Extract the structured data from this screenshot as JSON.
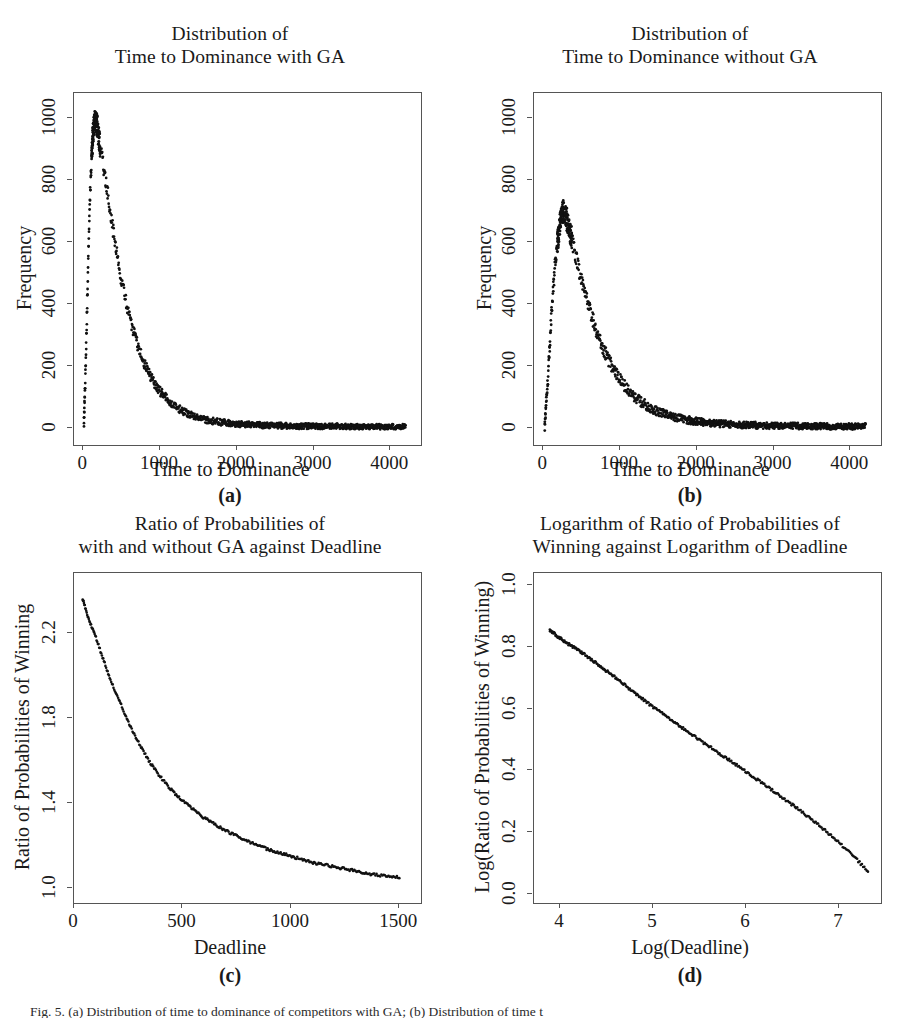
{
  "figure": {
    "caption": "Fig. 5. (a) Distribution of time to dominance of competitors with GA; (b) Distribution of time t"
  },
  "panels": [
    {
      "letter": "(a)",
      "title_line1": "Distribution of",
      "title_line2": "Time to Dominance with GA",
      "xlabel": "Time to Dominance",
      "ylabel": "Frequency",
      "xticks": [
        "0",
        "1000",
        "2000",
        "3000",
        "4000"
      ],
      "yticks": [
        "0",
        "200",
        "400",
        "600",
        "800",
        "1000"
      ]
    },
    {
      "letter": "(b)",
      "title_line1": "Distribution of",
      "title_line2": "Time to Dominance without GA",
      "xlabel": "Time to Dominance",
      "ylabel": "Frequency",
      "xticks": [
        "0",
        "1000",
        "2000",
        "3000",
        "4000"
      ],
      "yticks": [
        "0",
        "200",
        "400",
        "600",
        "800",
        "1000"
      ]
    },
    {
      "letter": "(c)",
      "title_line1": "Ratio of Probabilities of",
      "title_line2": "with and without GA against Deadline",
      "xlabel": "Deadline",
      "ylabel": "Ratio of Probabilities of Winning",
      "xticks": [
        "0",
        "500",
        "1000",
        "1500"
      ],
      "yticks": [
        "1.0",
        "1.4",
        "1.8",
        "2.2"
      ]
    },
    {
      "letter": "(d)",
      "title_line1": "Logarithm of Ratio of Probabilities of",
      "title_line2": "Winning against Logarithm of Deadline",
      "xlabel": "Log(Deadline)",
      "ylabel": "Log(Ratio of Probabilities of Winning)",
      "xticks": [
        "4",
        "5",
        "6",
        "7"
      ],
      "yticks": [
        "0.0",
        "0.2",
        "0.4",
        "0.6",
        "0.8",
        "1.0"
      ]
    }
  ],
  "chart_data": [
    {
      "id": "a",
      "type": "scatter",
      "title": "Distribution of Time to Dominance with GA",
      "xlabel": "Time to Dominance",
      "ylabel": "Frequency",
      "xlim": [
        -120,
        4400
      ],
      "ylim": [
        -55,
        1080
      ],
      "xticks": [
        0,
        1000,
        2000,
        3000,
        4000
      ],
      "yticks": [
        0,
        200,
        400,
        600,
        800,
        1000
      ],
      "grid": false,
      "legend": "none",
      "marker": "point",
      "color": "#111111",
      "model": "rise-then-exponential-decay",
      "peak_x": 150,
      "peak_y": 1000,
      "rise_start_x": 10,
      "decay_rate": 0.0022,
      "noise": 22,
      "n_points": 900,
      "x": [
        10,
        30,
        60,
        90,
        120,
        150,
        180,
        220,
        260,
        300,
        350,
        400,
        500,
        600,
        700,
        800,
        900,
        1000,
        1200,
        1400,
        1600,
        1800,
        2000,
        2400,
        2800,
        3200,
        3600,
        4000,
        4200
      ],
      "y": [
        20,
        180,
        480,
        760,
        930,
        1000,
        975,
        910,
        850,
        790,
        700,
        620,
        470,
        360,
        275,
        205,
        155,
        118,
        68,
        41,
        26,
        18,
        13,
        8,
        6,
        5,
        4,
        4,
        4
      ]
    },
    {
      "id": "b",
      "type": "scatter",
      "title": "Distribution of Time to Dominance without GA",
      "xlabel": "Time to Dominance",
      "ylabel": "Frequency",
      "xlim": [
        -120,
        4400
      ],
      "ylim": [
        -55,
        1080
      ],
      "xticks": [
        0,
        1000,
        2000,
        3000,
        4000
      ],
      "yticks": [
        0,
        200,
        400,
        600,
        800,
        1000
      ],
      "grid": false,
      "legend": "none",
      "marker": "point",
      "color": "#111111",
      "model": "rise-then-exponential-decay",
      "peak_x": 255,
      "peak_y": 700,
      "rise_start_x": 20,
      "decay_rate": 0.0018,
      "noise": 24,
      "n_points": 900,
      "x": [
        20,
        60,
        110,
        160,
        210,
        255,
        300,
        350,
        400,
        480,
        560,
        650,
        750,
        850,
        950,
        1100,
        1250,
        1400,
        1600,
        1800,
        2000,
        2300,
        2600,
        3000,
        3400,
        3800,
        4200
      ],
      "y": [
        10,
        150,
        380,
        540,
        645,
        700,
        680,
        630,
        580,
        490,
        420,
        345,
        275,
        220,
        175,
        122,
        88,
        64,
        42,
        29,
        21,
        14,
        10,
        7,
        6,
        5,
        5
      ]
    },
    {
      "id": "c",
      "type": "scatter",
      "title": "Ratio of Probabilities of with and without GA against Deadline",
      "xlabel": "Deadline",
      "ylabel": "Ratio of Probabilities of Winning",
      "xlim": [
        0,
        1600
      ],
      "ylim": [
        0.93,
        2.48
      ],
      "xticks": [
        0,
        500,
        1000,
        1500
      ],
      "yticks": [
        1.0,
        1.4,
        1.8,
        2.2
      ],
      "grid": false,
      "legend": "none",
      "marker": "point",
      "color": "#111111",
      "model": "monotonic-decay",
      "n_points": 330,
      "x": [
        40,
        60,
        80,
        100,
        120,
        140,
        160,
        180,
        200,
        230,
        260,
        300,
        350,
        400,
        450,
        500,
        600,
        700,
        800,
        900,
        1000,
        1100,
        1200,
        1300,
        1400,
        1500
      ],
      "y": [
        2.36,
        2.29,
        2.23,
        2.18,
        2.12,
        2.06,
        2.0,
        1.95,
        1.9,
        1.83,
        1.76,
        1.68,
        1.59,
        1.52,
        1.46,
        1.41,
        1.33,
        1.27,
        1.22,
        1.18,
        1.15,
        1.12,
        1.1,
        1.08,
        1.06,
        1.05
      ]
    },
    {
      "id": "d",
      "type": "scatter",
      "title": "Logarithm of Ratio of Probabilities of Winning against Logarithm of Deadline",
      "xlabel": "Log(Deadline)",
      "ylabel": "Log(Ratio of Probabilities of Winning)",
      "xlim": [
        3.72,
        7.45
      ],
      "ylim": [
        -0.03,
        1.04
      ],
      "xticks": [
        4,
        5,
        6,
        7
      ],
      "yticks": [
        0.0,
        0.2,
        0.4,
        0.6,
        0.8,
        1.0
      ],
      "grid": false,
      "legend": "none",
      "marker": "point",
      "color": "#111111",
      "model": "near-linear-decline",
      "n_points": 330,
      "x": [
        3.89,
        4.0,
        4.1,
        4.2,
        4.3,
        4.4,
        4.5,
        4.6,
        4.7,
        4.8,
        4.9,
        5.0,
        5.2,
        5.4,
        5.6,
        5.8,
        6.0,
        6.2,
        6.4,
        6.6,
        6.8,
        7.0,
        7.2,
        7.31
      ],
      "y": [
        0.855,
        0.828,
        0.808,
        0.789,
        0.768,
        0.745,
        0.722,
        0.7,
        0.676,
        0.652,
        0.628,
        0.606,
        0.562,
        0.52,
        0.478,
        0.437,
        0.396,
        0.352,
        0.31,
        0.265,
        0.218,
        0.166,
        0.108,
        0.072
      ]
    }
  ]
}
